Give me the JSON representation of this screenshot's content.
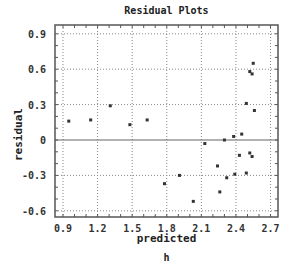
{
  "chart_data": {
    "type": "scatter",
    "title": "Residual Plots",
    "xlabel": "predicted",
    "ylabel": "residual",
    "subtitle_below": "h",
    "xlim": [
      0.85,
      2.75
    ],
    "ylim": [
      -0.65,
      0.98
    ],
    "xticks": [
      "0.9",
      "1.2",
      "1.5",
      "1.8",
      "2.1",
      "2.4",
      "2.7"
    ],
    "yticks": [
      "0.9",
      "0.6",
      "0.3",
      "0",
      "-0.3",
      "-0.6"
    ],
    "grid": true,
    "reference_line": 0,
    "series": [
      {
        "name": "residuals",
        "points": [
          {
            "x": 0.95,
            "y": 0.16
          },
          {
            "x": 1.14,
            "y": 0.17
          },
          {
            "x": 1.31,
            "y": 0.29
          },
          {
            "x": 1.48,
            "y": 0.13
          },
          {
            "x": 1.63,
            "y": 0.17
          },
          {
            "x": 1.78,
            "y": -0.37
          },
          {
            "x": 1.91,
            "y": -0.3
          },
          {
            "x": 2.03,
            "y": -0.52
          },
          {
            "x": 2.13,
            "y": -0.03
          },
          {
            "x": 2.24,
            "y": -0.22
          },
          {
            "x": 2.26,
            "y": -0.44
          },
          {
            "x": 2.3,
            "y": 0.0
          },
          {
            "x": 2.32,
            "y": -0.32
          },
          {
            "x": 2.38,
            "y": 0.03
          },
          {
            "x": 2.39,
            "y": -0.29
          },
          {
            "x": 2.43,
            "y": -0.13
          },
          {
            "x": 2.45,
            "y": 0.05
          },
          {
            "x": 2.49,
            "y": 0.31
          },
          {
            "x": 2.49,
            "y": -0.28
          },
          {
            "x": 2.52,
            "y": -0.11
          },
          {
            "x": 2.52,
            "y": 0.58
          },
          {
            "x": 2.54,
            "y": 0.56
          },
          {
            "x": 2.54,
            "y": -0.14
          },
          {
            "x": 2.55,
            "y": 0.65
          },
          {
            "x": 2.56,
            "y": 0.25
          }
        ]
      }
    ]
  },
  "colors": {
    "axis": "#555555",
    "grid": "#888888",
    "point": "#333333",
    "zero_line": "#666666"
  }
}
